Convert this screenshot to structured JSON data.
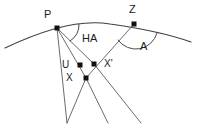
{
  "figure": {
    "width": 198,
    "height": 129,
    "background_color": "#ffffff",
    "line_color": "#4a4a4a",
    "point_color": "#111111",
    "text_color": "#1a1a1a"
  },
  "labels": {
    "pole": "P",
    "zenith": "Z",
    "hour_angle": "HA",
    "azimuth": "A",
    "u_point": "U",
    "x_point": "X",
    "x_prime_point": "X'"
  },
  "points": [
    {
      "name": "P",
      "label": "P",
      "x": 57,
      "y": 28,
      "label_x": 44,
      "label_y": 9
    },
    {
      "name": "Z",
      "label": "Z",
      "x": 134,
      "y": 24,
      "label_x": 129,
      "label_y": 4
    },
    {
      "name": "U",
      "label": "U",
      "x": 80,
      "y": 65,
      "label_x": 62,
      "label_y": 60
    },
    {
      "name": "X'",
      "label": "X'",
      "x": 94,
      "y": 64,
      "label_x": 104,
      "label_y": 59
    },
    {
      "name": "X",
      "label": "X",
      "x": 86,
      "y": 78,
      "label_x": 66,
      "label_y": 73
    }
  ],
  "angle_labels": [
    {
      "name": "HA",
      "label": "HA",
      "x": 82,
      "y": 33
    },
    {
      "name": "A",
      "label": "A",
      "x": 140,
      "y": 41
    }
  ],
  "geometry": {
    "horizon_arc": "M 5,48 Q 70,17 110,24 Q 160,31 191,42",
    "ray_p_to_bottom_left": "M 57,28 Q 62,75 67,123",
    "ray_p_through_xprime": "M 57,28 L 94,64 L 141,123",
    "ray_p_to_x": "M 57,28 L 86,78",
    "ray_z_through_x": "M 134,24 L 86,78 L 67,123",
    "ray_x_down": "M 86,78 L 108,123",
    "arc_ha": "M 70,41 A 18,18 0 0 0 79,24",
    "arc_a": "M 118,40 A 22,22 0 0 0 157,33"
  }
}
